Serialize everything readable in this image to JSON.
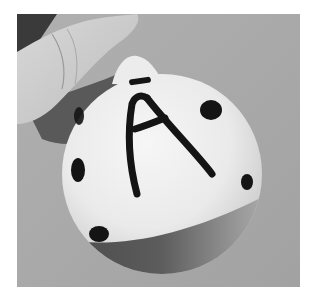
{
  "image": {
    "subject": "hand holding a white round ornament with a hand-painted letter A",
    "letter": "A",
    "palette": {
      "background": "#a6a6a6",
      "ornament": "#eeeeee",
      "paint": "#141414",
      "band": "#5a5a5a",
      "skin": "#cfcfcf",
      "page": "#ffffff"
    }
  }
}
